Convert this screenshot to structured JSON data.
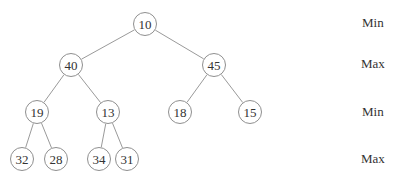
{
  "diagram": {
    "type": "min-max heap tree",
    "edge_color": "#9a9a9a",
    "node_border_color": "#8f8f8f",
    "nodes": [
      {
        "id": "n0",
        "value": "10",
        "x": 145,
        "y": 24
      },
      {
        "id": "n1",
        "value": "40",
        "x": 71,
        "y": 65
      },
      {
        "id": "n2",
        "value": "45",
        "x": 214,
        "y": 65
      },
      {
        "id": "n3",
        "value": "19",
        "x": 37,
        "y": 112
      },
      {
        "id": "n4",
        "value": "13",
        "x": 108,
        "y": 112
      },
      {
        "id": "n5",
        "value": "18",
        "x": 180,
        "y": 112
      },
      {
        "id": "n6",
        "value": "15",
        "x": 250,
        "y": 112
      },
      {
        "id": "n7",
        "value": "32",
        "x": 22,
        "y": 159
      },
      {
        "id": "n8",
        "value": "28",
        "x": 56,
        "y": 159
      },
      {
        "id": "n9",
        "value": "34",
        "x": 99,
        "y": 159
      },
      {
        "id": "n10",
        "value": "31",
        "x": 127,
        "y": 159
      }
    ],
    "edges": [
      [
        "n0",
        "n1"
      ],
      [
        "n0",
        "n2"
      ],
      [
        "n1",
        "n3"
      ],
      [
        "n1",
        "n4"
      ],
      [
        "n2",
        "n5"
      ],
      [
        "n2",
        "n6"
      ],
      [
        "n3",
        "n7"
      ],
      [
        "n3",
        "n8"
      ],
      [
        "n4",
        "n9"
      ],
      [
        "n4",
        "n10"
      ]
    ],
    "level_labels": [
      {
        "text": "Min",
        "y": 23
      },
      {
        "text": "Max",
        "y": 64
      },
      {
        "text": "Min",
        "y": 112
      },
      {
        "text": "Max",
        "y": 159
      }
    ]
  }
}
